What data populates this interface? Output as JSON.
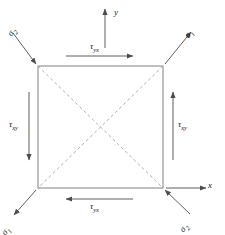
{
  "figure": {
    "colors": {
      "element_stroke": "#808080",
      "diagonal_stroke": "#a8a8a8",
      "arrow_stroke": "#4d4d4d",
      "text": "#1a1a1a",
      "background": "#ffffff"
    },
    "element": {
      "shape": "square",
      "left": 38,
      "top": 66,
      "right": 163,
      "bottom": 188,
      "diagonals": "dashed"
    }
  },
  "axes": {
    "y": {
      "label": "y",
      "direction": "up"
    },
    "x": {
      "label": "x",
      "direction": "right"
    }
  },
  "shear_labels": {
    "top": {
      "symbol": "τ",
      "subscript": "yx",
      "direction": "right"
    },
    "bottom": {
      "symbol": "τ",
      "subscript": "yx",
      "direction": "left"
    },
    "left": {
      "symbol": "τ",
      "subscript": "xy",
      "direction": "down"
    },
    "right": {
      "symbol": "τ",
      "subscript": "xy",
      "direction": "up"
    }
  },
  "principal_stresses": {
    "top_left": {
      "symbol": "σ",
      "subscript": "2",
      "direction": "inward"
    },
    "top_right": {
      "symbol": "σ",
      "subscript": "1",
      "direction": "outward"
    },
    "bottom_left": {
      "symbol": "σ",
      "subscript": "1",
      "direction": "outward"
    },
    "bottom_right": {
      "symbol": "σ",
      "subscript": "2",
      "direction": "inward"
    }
  }
}
